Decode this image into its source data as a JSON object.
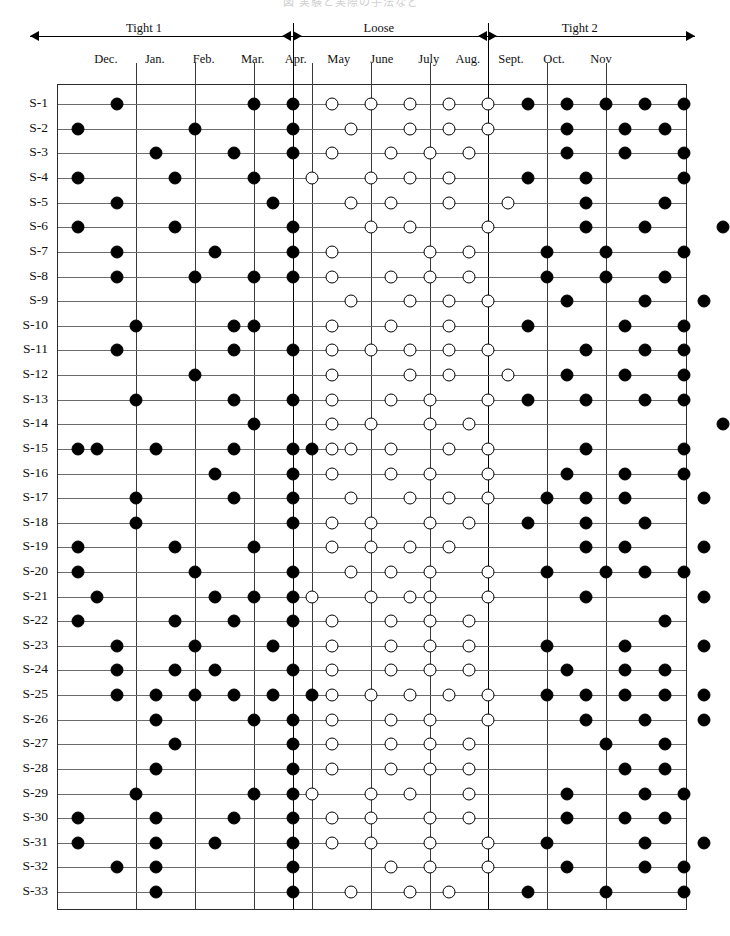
{
  "figure": {
    "cropped_title": "図  実験と実際の手法など",
    "row_label_prefix": "S-"
  },
  "phases": [
    {
      "name": "Tight 1",
      "start_col": 0,
      "end_col": 11
    },
    {
      "name": "Loose",
      "start_col": 11,
      "end_col": 21
    },
    {
      "name": "Tight 2",
      "start_col": 21,
      "end_col": 31
    }
  ],
  "months": [
    {
      "label": "Dec.",
      "col": 1.5
    },
    {
      "label": "Jan.",
      "col": 4.0
    },
    {
      "label": "Feb.",
      "col": 6.5
    },
    {
      "label": "Mar.",
      "col": 9.0
    },
    {
      "label": "Apr.",
      "col": 11.2
    },
    {
      "label": "May",
      "col": 13.4
    },
    {
      "label": "June",
      "col": 15.6
    },
    {
      "label": "July",
      "col": 18.0
    },
    {
      "label": "Aug.",
      "col": 20.0
    },
    {
      "label": "Sept.",
      "col": 22.2
    },
    {
      "label": "Oct.",
      "col": 24.4
    },
    {
      "label": "Nov",
      "col": 26.8
    }
  ],
  "chart_data": {
    "type": "scatter",
    "xlabel": "Month",
    "ylabel": "Sample",
    "grid": true,
    "legend": [
      {
        "symbol": "filled-circle",
        "label": "Tight period observation",
        "color": "#000000"
      },
      {
        "symbol": "open-circle",
        "label": "Loose period observation",
        "color": "#ffffff"
      }
    ],
    "n_rows": 33,
    "n_cols": 31,
    "col_gridlines": [
      3,
      6,
      9,
      12,
      15,
      18,
      21,
      24,
      27
    ],
    "phase_boundaries": [
      11,
      21
    ],
    "row_labels": [
      "S-1",
      "S-2",
      "S-3",
      "S-4",
      "S-5",
      "S-6",
      "S-7",
      "S-8",
      "S-9",
      "S-10",
      "S-11",
      "S-12",
      "S-13",
      "S-14",
      "S-15",
      "S-16",
      "S-17",
      "S-18",
      "S-19",
      "S-20",
      "S-21",
      "S-22",
      "S-23",
      "S-24",
      "S-25",
      "S-26",
      "S-27",
      "S-28",
      "S-29",
      "S-30",
      "S-31",
      "S-32",
      "S-33"
    ],
    "marks": [
      {
        "row": 0,
        "filled": [
          2,
          9,
          11,
          23,
          25,
          27,
          29,
          31
        ],
        "open": [
          13,
          15,
          17,
          19,
          21
        ]
      },
      {
        "row": 1,
        "filled": [
          0,
          6,
          11,
          25,
          28,
          30
        ],
        "open": [
          14,
          17,
          19,
          21
        ]
      },
      {
        "row": 2,
        "filled": [
          4,
          8,
          11,
          25,
          28,
          31
        ],
        "open": [
          13,
          16,
          18,
          20
        ]
      },
      {
        "row": 3,
        "filled": [
          0,
          5,
          9,
          23,
          26,
          31
        ],
        "open": [
          12,
          15,
          17,
          19
        ]
      },
      {
        "row": 4,
        "filled": [
          2,
          10,
          26,
          30
        ],
        "open": [
          14,
          16,
          19,
          22
        ]
      },
      {
        "row": 5,
        "filled": [
          0,
          5,
          11,
          26,
          29,
          33
        ],
        "open": [
          15,
          17,
          21
        ]
      },
      {
        "row": 6,
        "filled": [
          2,
          7,
          11,
          24,
          27,
          31
        ],
        "open": [
          13,
          18,
          20
        ]
      },
      {
        "row": 7,
        "filled": [
          2,
          6,
          9,
          11,
          24,
          27,
          30
        ],
        "open": [
          13,
          16,
          18,
          20
        ]
      },
      {
        "row": 8,
        "filled": [
          25,
          29,
          32
        ],
        "open": [
          14,
          17,
          19,
          21
        ]
      },
      {
        "row": 9,
        "filled": [
          3,
          8,
          9,
          23,
          28,
          31
        ],
        "open": [
          13,
          16,
          19
        ]
      },
      {
        "row": 10,
        "filled": [
          2,
          8,
          11,
          26,
          29,
          31
        ],
        "open": [
          13,
          15,
          17,
          19,
          21
        ]
      },
      {
        "row": 11,
        "filled": [
          6,
          25,
          28,
          31
        ],
        "open": [
          13,
          17,
          19,
          22
        ]
      },
      {
        "row": 12,
        "filled": [
          3,
          8,
          11,
          23,
          26,
          29,
          31
        ],
        "open": [
          13,
          16,
          18,
          21
        ]
      },
      {
        "row": 13,
        "filled": [
          9,
          33
        ],
        "open": [
          13,
          15,
          18,
          20
        ]
      },
      {
        "row": 14,
        "filled": [
          0,
          1,
          4,
          8,
          11,
          12,
          26,
          31
        ],
        "open": [
          13,
          14,
          16,
          19,
          21
        ]
      },
      {
        "row": 15,
        "filled": [
          7,
          11,
          25,
          28,
          31
        ],
        "open": [
          13,
          16,
          18,
          21
        ]
      },
      {
        "row": 16,
        "filled": [
          3,
          8,
          11,
          24,
          26,
          28,
          32
        ],
        "open": [
          14,
          17,
          19,
          21
        ]
      },
      {
        "row": 17,
        "filled": [
          3,
          11,
          23,
          26,
          29
        ],
        "open": [
          13,
          15,
          18,
          20
        ]
      },
      {
        "row": 18,
        "filled": [
          0,
          5,
          9,
          26,
          28,
          32
        ],
        "open": [
          13,
          15,
          17,
          19
        ]
      },
      {
        "row": 19,
        "filled": [
          0,
          6,
          11,
          24,
          27,
          29,
          31
        ],
        "open": [
          14,
          16,
          18,
          21
        ]
      },
      {
        "row": 20,
        "filled": [
          1,
          7,
          9,
          11,
          26,
          32
        ],
        "open": [
          12,
          15,
          17,
          18,
          21
        ]
      },
      {
        "row": 21,
        "filled": [
          0,
          5,
          8,
          11,
          30
        ],
        "open": [
          13,
          16,
          18,
          20
        ]
      },
      {
        "row": 22,
        "filled": [
          2,
          6,
          10,
          24,
          28,
          32
        ],
        "open": [
          13,
          16,
          18,
          20
        ]
      },
      {
        "row": 23,
        "filled": [
          2,
          5,
          7,
          11,
          25,
          28,
          30
        ],
        "open": [
          13,
          16,
          18,
          20
        ]
      },
      {
        "row": 24,
        "filled": [
          2,
          4,
          6,
          8,
          10,
          12,
          24,
          26,
          28,
          30,
          32
        ],
        "open": [
          13,
          15,
          17,
          19,
          21
        ]
      },
      {
        "row": 25,
        "filled": [
          4,
          9,
          11,
          26,
          29,
          32
        ],
        "open": [
          13,
          16,
          18,
          21
        ]
      },
      {
        "row": 26,
        "filled": [
          5,
          11,
          27,
          30
        ],
        "open": [
          13,
          16,
          18,
          20
        ]
      },
      {
        "row": 27,
        "filled": [
          4,
          11,
          28,
          30
        ],
        "open": [
          13,
          16,
          18,
          20
        ]
      },
      {
        "row": 28,
        "filled": [
          3,
          9,
          11,
          25,
          29,
          31
        ],
        "open": [
          12,
          15,
          17,
          20
        ]
      },
      {
        "row": 29,
        "filled": [
          0,
          4,
          8,
          11,
          25,
          28,
          30
        ],
        "open": [
          13,
          15,
          18,
          20
        ]
      },
      {
        "row": 30,
        "filled": [
          0,
          4,
          7,
          11,
          24,
          29,
          32
        ],
        "open": [
          13,
          15,
          18,
          21
        ]
      },
      {
        "row": 31,
        "filled": [
          2,
          4,
          11,
          25,
          29,
          31
        ],
        "open": [
          16,
          18,
          21
        ]
      },
      {
        "row": 32,
        "filled": [
          4,
          11,
          23,
          27,
          31
        ],
        "open": [
          14,
          17,
          19
        ]
      }
    ]
  }
}
